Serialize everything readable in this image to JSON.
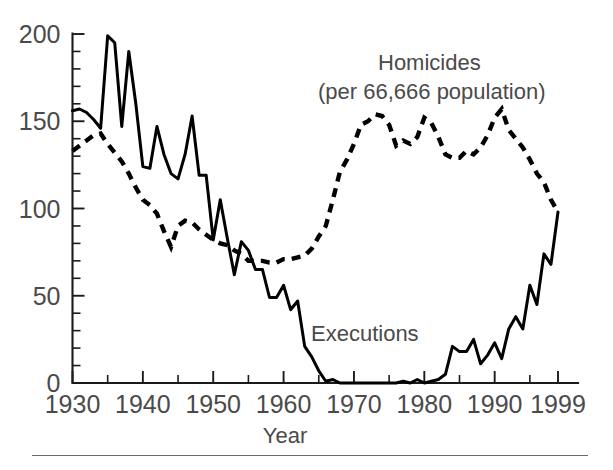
{
  "chart_data": {
    "type": "line",
    "title": "",
    "xlabel": "Year",
    "ylabel": "",
    "xlim": [
      1930,
      1999
    ],
    "ylim": [
      0,
      200
    ],
    "grid": false,
    "legend_position": "in-plot",
    "x_tick_labels": [
      "1930",
      "1940",
      "1950",
      "1960",
      "1970",
      "1980",
      "1990",
      "1999"
    ],
    "x_tick_values": [
      1930,
      1940,
      1950,
      1960,
      1970,
      1980,
      1990,
      1999
    ],
    "x_minor_tick_step": 5,
    "y_tick_labels": [
      "0",
      "50",
      "100",
      "150",
      "200"
    ],
    "y_tick_values": [
      0,
      50,
      100,
      150,
      200
    ],
    "y_minor_tick_step": 10,
    "annotations": [
      {
        "name": "homicides-label",
        "text_line1": "Homicides",
        "text_line2": "(per 66,666 population)",
        "x": 1977,
        "y": 182
      },
      {
        "name": "executions-label",
        "text_line1": "Executions",
        "text_line2": "",
        "x": 1968,
        "y": 38
      }
    ],
    "x": [
      1930,
      1931,
      1932,
      1933,
      1934,
      1935,
      1936,
      1937,
      1938,
      1939,
      1940,
      1941,
      1942,
      1943,
      1944,
      1945,
      1946,
      1947,
      1948,
      1949,
      1950,
      1951,
      1952,
      1953,
      1954,
      1955,
      1956,
      1957,
      1958,
      1959,
      1960,
      1961,
      1962,
      1963,
      1964,
      1965,
      1966,
      1967,
      1968,
      1969,
      1970,
      1971,
      1972,
      1973,
      1974,
      1975,
      1976,
      1977,
      1978,
      1979,
      1980,
      1981,
      1982,
      1983,
      1984,
      1985,
      1986,
      1987,
      1988,
      1989,
      1990,
      1991,
      1992,
      1993,
      1994,
      1995,
      1996,
      1997,
      1998,
      1999
    ],
    "series": [
      {
        "name": "Executions",
        "style": "solid",
        "values": [
          156,
          157,
          155,
          151,
          146,
          199,
          195,
          147,
          190,
          160,
          124,
          123,
          147,
          131,
          120,
          117,
          131,
          153,
          119,
          119,
          82,
          105,
          83,
          62,
          81,
          76,
          65,
          65,
          49,
          49,
          56,
          42,
          47,
          21,
          15,
          7,
          1,
          2,
          0,
          0,
          0,
          0,
          0,
          0,
          0,
          0,
          0,
          1,
          0,
          2,
          0,
          1,
          2,
          5,
          21,
          18,
          18,
          25,
          11,
          16,
          23,
          14,
          31,
          38,
          31,
          56,
          45,
          74,
          68,
          98
        ]
      },
      {
        "name": "Homicides",
        "style": "dashed",
        "values": [
          133,
          136,
          139,
          142,
          143,
          137,
          132,
          127,
          120,
          112,
          105,
          102,
          97,
          87,
          78,
          90,
          93,
          92,
          88,
          85,
          82,
          80,
          79,
          76,
          74,
          70,
          70,
          70,
          69,
          69,
          71,
          71,
          72,
          73,
          77,
          84,
          90,
          105,
          121,
          128,
          137,
          148,
          150,
          154,
          153,
          148,
          136,
          139,
          137,
          141,
          152,
          149,
          141,
          131,
          129,
          129,
          133,
          131,
          135,
          142,
          152,
          157,
          145,
          140,
          135,
          128,
          120,
          115,
          105,
          98
        ]
      }
    ]
  }
}
